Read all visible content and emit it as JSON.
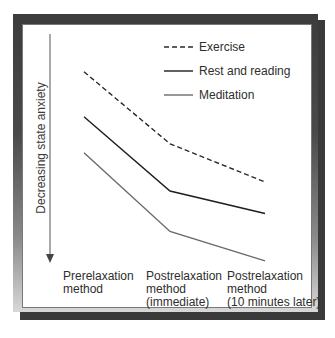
{
  "chart_data": {
    "type": "line",
    "title": "",
    "xlabel": "",
    "ylabel": "Decreasing state anxiety",
    "y_direction": "down (arrow points downward = less anxiety)",
    "categories": [
      "Prerelaxation method",
      "Postrelaxation method (immediate)",
      "Postrelaxation method (10 minutes later)"
    ],
    "category_lines": [
      [
        "Prerelaxation",
        "method"
      ],
      [
        "Postrelaxation",
        "method",
        "(immediate)"
      ],
      [
        "Postrelaxation",
        "method",
        "(10 minutes later)"
      ]
    ],
    "series": [
      {
        "name": "Exercise",
        "style": "dashed",
        "color": "#2a2a2a",
        "values": [
          85,
          53,
          36
        ]
      },
      {
        "name": "Rest and reading",
        "style": "solid",
        "color": "#1e1e1e",
        "values": [
          65,
          32,
          22
        ]
      },
      {
        "name": "Meditation",
        "style": "solid",
        "color": "#6a6a6a",
        "values": [
          49,
          14,
          1
        ]
      }
    ],
    "values_note": "Relative anxiety level (arbitrary units, higher = more anxiety); no numeric axis shown",
    "ylim": [
      0,
      100
    ],
    "grid": false,
    "legend_position": "top-right"
  },
  "legend": {
    "items": [
      {
        "label": "Exercise"
      },
      {
        "label": "Rest and reading"
      },
      {
        "label": "Meditation"
      }
    ]
  }
}
